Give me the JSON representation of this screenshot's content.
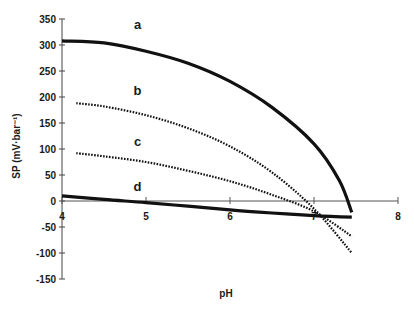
{
  "chart_data": {
    "type": "line",
    "title": "",
    "xlabel": "pH",
    "ylabel": "SP (mV·bar⁻¹)",
    "xlim": [
      4,
      8
    ],
    "ylim": [
      -150,
      350
    ],
    "x_ticks": [
      4,
      5,
      6,
      7,
      8
    ],
    "y_ticks": [
      350,
      300,
      250,
      200,
      150,
      100,
      50,
      0,
      -50,
      -100,
      -150
    ],
    "grid": false,
    "legend": "inline curve labels a, b, c, d",
    "series": [
      {
        "name": "a",
        "style": "solid-thick",
        "x": [
          4.0,
          4.5,
          5.0,
          5.5,
          6.0,
          6.5,
          7.0,
          7.3,
          7.45
        ],
        "y": [
          308,
          304,
          288,
          265,
          230,
          180,
          110,
          40,
          -22
        ],
        "label_pos": [
          4.9,
          330
        ]
      },
      {
        "name": "b",
        "style": "dotted",
        "x": [
          4.17,
          4.5,
          5.0,
          5.5,
          6.0,
          6.5,
          7.0,
          7.45
        ],
        "y": [
          188,
          182,
          165,
          140,
          105,
          55,
          -15,
          -100
        ],
        "label_pos": [
          4.9,
          203
        ]
      },
      {
        "name": "c",
        "style": "dotted",
        "x": [
          4.17,
          4.5,
          5.0,
          5.5,
          6.0,
          6.5,
          7.0,
          7.45
        ],
        "y": [
          92,
          86,
          75,
          58,
          38,
          12,
          -20,
          -68
        ],
        "label_pos": [
          4.9,
          105
        ]
      },
      {
        "name": "d",
        "style": "solid-thick",
        "x": [
          4.0,
          4.5,
          5.0,
          5.5,
          6.0,
          6.5,
          7.0,
          7.45
        ],
        "y": [
          10,
          3,
          -3,
          -10,
          -17,
          -23,
          -28,
          -31
        ],
        "label_pos": [
          4.9,
          20
        ]
      }
    ]
  }
}
